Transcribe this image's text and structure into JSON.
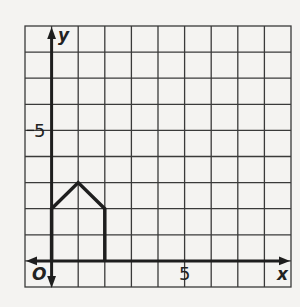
{
  "figure": {
    "type": "coordinate-grid",
    "axes": {
      "x_label": "x",
      "y_label": "y",
      "origin_label": "O",
      "x_tick_label": "5",
      "y_tick_label": "5",
      "x_range": [
        -1,
        9
      ],
      "y_range": [
        -1,
        9
      ]
    },
    "shape": {
      "name": "house pentagon",
      "vertices": [
        [
          0,
          0
        ],
        [
          0,
          2
        ],
        [
          1,
          3
        ],
        [
          2,
          2
        ],
        [
          2,
          0
        ]
      ],
      "stroke_color": "#1e1e1e"
    },
    "colors": {
      "background": "#f4f3f1",
      "grid": "#3a3a3a",
      "axis": "#1e1e1e"
    }
  }
}
